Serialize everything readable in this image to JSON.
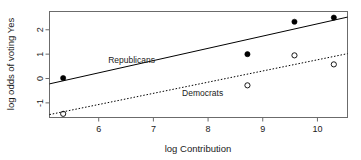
{
  "chart_data": {
    "type": "scatter",
    "title": "",
    "subtitle": "",
    "xlabel": "log Contribution",
    "ylabel": "log odds of voting Yes",
    "xlim": [
      5.1,
      10.55
    ],
    "ylim": [
      -1.6,
      2.75
    ],
    "xticks": [
      6,
      7,
      8,
      9,
      10
    ],
    "xticklabels": [
      "6",
      "7",
      "8",
      "9",
      "10"
    ],
    "yticks": [
      -1,
      0,
      1,
      2
    ],
    "yticklabels": [
      "-1",
      "0",
      "1",
      "2"
    ],
    "grid": false,
    "legend_position": "inline-annotation",
    "series": [
      {
        "name": "Republicans",
        "marker": "filled-circle",
        "color": "#000000",
        "line_style": "solid",
        "x": [
          5.35,
          8.72,
          9.58,
          10.3
        ],
        "y": [
          0.02,
          1.0,
          2.33,
          2.5
        ],
        "fit_line": {
          "x0": 5.1,
          "y0": -0.22,
          "x1": 10.55,
          "y1": 2.52
        }
      },
      {
        "name": "Democrats",
        "marker": "open-circle",
        "color": "#000000",
        "line_style": "dotted",
        "x": [
          5.35,
          8.72,
          9.58,
          10.3
        ],
        "y": [
          -1.45,
          -0.28,
          0.95,
          0.58
        ],
        "fit_line": {
          "x0": 5.1,
          "y0": -1.48,
          "x1": 10.55,
          "y1": 1.02
        }
      }
    ],
    "annotations": [
      {
        "text": "Republicans",
        "x": 6.6,
        "y": 0.62
      },
      {
        "text": "Democrats",
        "x": 7.9,
        "y": -0.73
      }
    ]
  }
}
